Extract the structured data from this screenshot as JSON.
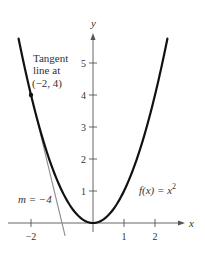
{
  "chart_data": {
    "type": "line",
    "title": "",
    "xlabel": "x",
    "ylabel": "y",
    "xlim": [
      -2.5,
      3.0
    ],
    "ylim": [
      -0.5,
      6.0
    ],
    "grid": false,
    "x_ticks": [
      {
        "value": -2,
        "label": "−2"
      },
      {
        "value": 1,
        "label": "1"
      },
      {
        "value": 2,
        "label": "2"
      }
    ],
    "y_ticks": [
      {
        "value": 1,
        "label": "1"
      },
      {
        "value": 2,
        "label": "2"
      },
      {
        "value": 3,
        "label": "3"
      },
      {
        "value": 4,
        "label": "4"
      },
      {
        "value": 5,
        "label": "5"
      }
    ],
    "series": [
      {
        "name": "f(x) = x^2",
        "kind": "curve",
        "color": "#111111",
        "x_range": [
          -2.4,
          2.4
        ],
        "formula": "x^2"
      },
      {
        "name": "Tangent line at (-2, 4)",
        "kind": "line",
        "color": "#888888",
        "x_range": [
          -2.05,
          -0.9
        ],
        "formula": "-4x - 4",
        "slope": -4
      }
    ],
    "points": [
      {
        "x": -2,
        "y": 4,
        "label": "(−2, 4)"
      }
    ],
    "annotations": {
      "tangent_label_line1": "Tangent",
      "tangent_label_line2": "line at",
      "tangent_label_line3": "(−2, 4)",
      "slope_label": "m = −4",
      "function_label_prefix": "f(x) = x",
      "function_label_exp": "2"
    }
  }
}
